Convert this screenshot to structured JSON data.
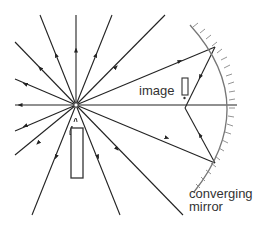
{
  "diagram": {
    "labels": {
      "image": "image",
      "mirror_line1": "converging",
      "mirror_line2": "mirror"
    },
    "colors": {
      "ray": "#222222",
      "mirror": "#777777",
      "candle": "#333333"
    },
    "source": {
      "x": 76,
      "y": 105
    },
    "rays": [
      {
        "x": 40,
        "y": 15
      },
      {
        "x": 76,
        "y": 15
      },
      {
        "x": 112,
        "y": 15
      },
      {
        "x": 165,
        "y": 15
      },
      {
        "x": 15,
        "y": 42
      },
      {
        "x": 15,
        "y": 79
      },
      {
        "x": 15,
        "y": 131
      },
      {
        "x": 15,
        "y": 155
      },
      {
        "x": 32,
        "y": 215
      },
      {
        "x": 120,
        "y": 215
      },
      {
        "x": 183,
        "y": 215
      }
    ],
    "mirror_rays": [
      {
        "hit": {
          "x": 215,
          "y": 47
        }
      },
      {
        "hit": {
          "x": 215,
          "y": 163
        }
      }
    ]
  }
}
